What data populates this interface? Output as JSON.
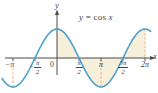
{
  "figure": {
    "equation": {
      "lhs": "y",
      "rel": "=",
      "fn": "cos",
      "arg": "x"
    },
    "axis_labels": {
      "x": "x",
      "y": "y"
    }
  },
  "chart_data": {
    "type": "line",
    "function": "y = cos(x)",
    "x_domain_pi": [
      -1.25,
      2.13
    ],
    "y_range": [
      -1,
      1
    ],
    "amplitude": 1,
    "shaded_interval_pi": [
      0,
      2
    ],
    "grid": false,
    "x_ticks": [
      {
        "value_pi": -1,
        "label": "−π",
        "frac": false
      },
      {
        "value_pi": -0.5,
        "label": "−π/2",
        "frac": true,
        "prefix": "−",
        "num": "π",
        "den": "2"
      },
      {
        "value_pi": 0,
        "label": "0",
        "frac": false,
        "origin": true
      },
      {
        "value_pi": 0.5,
        "label": "π/2",
        "frac": true,
        "prefix": "",
        "num": "π",
        "den": "2"
      },
      {
        "value_pi": 1,
        "label": "π",
        "frac": false
      },
      {
        "value_pi": 1.5,
        "label": "3π/2",
        "frac": true,
        "prefix": "",
        "num": "3π",
        "den": "2"
      },
      {
        "value_pi": 2,
        "label": "2π",
        "frac": false
      }
    ],
    "guides_pi": [
      {
        "x_pi": -1,
        "y": -1
      },
      {
        "x_pi": 1,
        "y": -1
      },
      {
        "x_pi": 2,
        "y": 1
      }
    ],
    "key_points": [
      {
        "x": "−π",
        "y": -1
      },
      {
        "x": "−π/2",
        "y": 0
      },
      {
        "x": "0",
        "y": 1
      },
      {
        "x": "π/2",
        "y": 0
      },
      {
        "x": "π",
        "y": -1
      },
      {
        "x": "3π/2",
        "y": 0
      },
      {
        "x": "2π",
        "y": 1
      }
    ],
    "colors": {
      "curve": "#4FA0CC",
      "shading": "#F6EFDA",
      "guides": "#EBAD85",
      "axis": "#4A4A4A"
    }
  }
}
